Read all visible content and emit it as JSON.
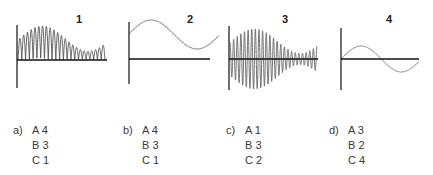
{
  "graphs": [
    {
      "id": "1",
      "label": "1",
      "label_pos": [
        76,
        14
      ],
      "axis": {
        "x": 17,
        "y_top": 25,
        "y_bottom": 88,
        "baseline_y": 60,
        "x_end": 107
      },
      "type": "rectified-beat",
      "description": "Positive-only (rectified) oscillation with beating envelope: large early, decays, then grows at end",
      "color": "#555555"
    },
    {
      "id": "2",
      "label": "2",
      "label_pos": [
        187,
        14
      ],
      "axis": {
        "x": 129,
        "y_top": 22,
        "y_bottom": 84,
        "baseline_y": 59,
        "x_end": 210
      },
      "type": "offset-sine",
      "description": "Single slow sine wave offset above baseline",
      "color": "#888888"
    },
    {
      "id": "3",
      "label": "3",
      "label_pos": [
        282,
        14
      ],
      "axis": {
        "x": 229,
        "y_top": 26,
        "y_bottom": 90,
        "baseline_y": 59,
        "x_end": 318
      },
      "type": "beat",
      "description": "Full fast oscillation with beating envelope around baseline",
      "color": "#666666"
    },
    {
      "id": "4",
      "label": "4",
      "label_pos": [
        386,
        14
      ],
      "axis": {
        "x": 341,
        "y_top": 28,
        "y_bottom": 90,
        "baseline_y": 59,
        "x_end": 419
      },
      "type": "sine",
      "description": "Single slow sine wave centered on baseline",
      "color": "#999999"
    }
  ],
  "options": [
    {
      "letter": "a)",
      "x": 13,
      "pairs": [
        "A 4",
        "B 3",
        "C 1"
      ]
    },
    {
      "letter": "b)",
      "x": 123,
      "pairs": [
        "A 4",
        "B 3",
        "C 1"
      ]
    },
    {
      "letter": "c)",
      "x": 226,
      "pairs": [
        "A 1",
        "B 3",
        "C 2"
      ]
    },
    {
      "letter": "d)",
      "x": 329,
      "pairs": [
        "A 3",
        "B 2",
        "C 4"
      ]
    }
  ]
}
